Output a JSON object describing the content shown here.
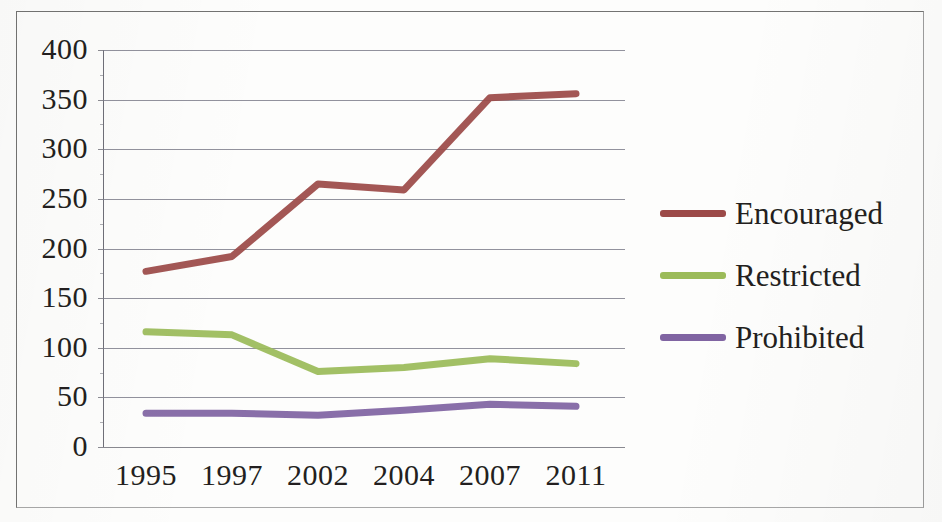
{
  "chart_data": {
    "type": "line",
    "title": "",
    "xlabel": "",
    "ylabel": "",
    "categories": [
      "1995",
      "1997",
      "2002",
      "2004",
      "2007",
      "2011"
    ],
    "ylim": [
      0,
      400
    ],
    "ytick_labels": [
      "400",
      "350",
      "300",
      "250",
      "200",
      "150",
      "100",
      "50",
      "0"
    ],
    "ytick_values": [
      400,
      350,
      300,
      250,
      200,
      150,
      100,
      50,
      0
    ],
    "grid": "horizontal",
    "legend_position": "right",
    "series": [
      {
        "name": "Encouraged",
        "color": "#9c4a48",
        "values": [
          177,
          192,
          265,
          259,
          352,
          356
        ]
      },
      {
        "name": "Restricted",
        "color": "#9bbb59",
        "values": [
          116,
          113,
          76,
          80,
          89,
          84
        ]
      },
      {
        "name": "Prohibited",
        "color": "#8064a2",
        "values": [
          34,
          34,
          32,
          37,
          43,
          41
        ]
      }
    ]
  },
  "legend": {
    "items": [
      {
        "label": "Encouraged",
        "color": "#9c4a48"
      },
      {
        "label": "Restricted",
        "color": "#9bbb59"
      },
      {
        "label": "Prohibited",
        "color": "#8064a2"
      }
    ]
  },
  "axes": {
    "y_labels": [
      "400",
      "350",
      "300",
      "250",
      "200",
      "150",
      "100",
      "50",
      "0"
    ],
    "x_labels": [
      "1995",
      "1997",
      "2002",
      "2004",
      "2007",
      "2011"
    ]
  },
  "colors": {
    "encouraged": "#9c4a48",
    "restricted": "#9bbb59",
    "prohibited": "#8064a2",
    "gridline": "#7a7a88",
    "text": "#231f20",
    "border": "#5b5b5b"
  }
}
